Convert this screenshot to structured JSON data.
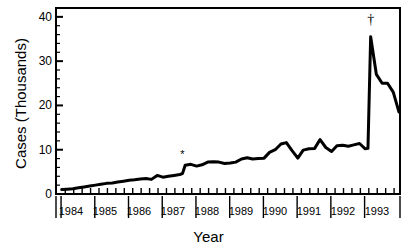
{
  "chart_data": {
    "type": "line",
    "title": "",
    "xlabel": "Year",
    "ylabel": "Cases (Thousands)",
    "ylim": [
      0,
      42
    ],
    "xlim": [
      1983.75,
      1993.95
    ],
    "grid": false,
    "legend": null,
    "y_ticks": [
      0,
      10,
      20,
      30,
      40
    ],
    "y_tick_labels": [
      "0",
      "10",
      "20",
      "30",
      "40"
    ],
    "y_minor_tick_step": 2,
    "x_tick_labels": [
      "1984",
      "1985",
      "1986",
      "1987",
      "1988",
      "1989",
      "1990",
      "1991",
      "1992",
      "1993"
    ],
    "x_ticks_per_year": 4,
    "annotations": [
      {
        "text": "*",
        "x": 1987.5,
        "y": 8.2
      },
      {
        "text": "†",
        "x": 1993.08,
        "y": 38.5
      }
    ],
    "series": [
      {
        "name": "Cases",
        "color": "#000000",
        "x": [
          1983.92,
          1984.08,
          1984.25,
          1984.42,
          1984.58,
          1984.75,
          1984.92,
          1985.08,
          1985.25,
          1985.42,
          1985.58,
          1985.75,
          1985.92,
          1986.08,
          1986.25,
          1986.42,
          1986.58,
          1986.75,
          1986.92,
          1987.08,
          1987.25,
          1987.42,
          1987.5,
          1987.58,
          1987.75,
          1987.92,
          1988.08,
          1988.25,
          1988.42,
          1988.58,
          1988.75,
          1988.92,
          1989.08,
          1989.25,
          1989.42,
          1989.58,
          1989.75,
          1989.92,
          1990.08,
          1990.25,
          1990.42,
          1990.58,
          1990.75,
          1990.92,
          1991.08,
          1991.25,
          1991.42,
          1991.58,
          1991.75,
          1991.92,
          1992.08,
          1992.25,
          1992.42,
          1992.58,
          1992.75,
          1992.92,
          1993.0,
          1993.08,
          1993.25,
          1993.42,
          1993.58,
          1993.75,
          1993.92
        ],
        "y": [
          1.0,
          1.1,
          1.2,
          1.4,
          1.6,
          1.8,
          2.0,
          2.2,
          2.4,
          2.5,
          2.7,
          2.9,
          3.1,
          3.2,
          3.4,
          3.5,
          3.3,
          4.2,
          3.8,
          4.0,
          4.2,
          4.4,
          4.6,
          6.5,
          6.7,
          6.3,
          6.6,
          7.2,
          7.3,
          7.2,
          6.9,
          7.0,
          7.2,
          7.9,
          8.2,
          7.9,
          8.0,
          8.1,
          9.4,
          10.0,
          11.3,
          11.6,
          9.8,
          8.1,
          9.9,
          10.2,
          10.3,
          12.3,
          10.5,
          9.6,
          10.9,
          11.0,
          10.8,
          11.1,
          11.4,
          10.2,
          10.3,
          35.5,
          27.0,
          25.0,
          25.0,
          23.0,
          18.5
        ]
      }
    ]
  }
}
